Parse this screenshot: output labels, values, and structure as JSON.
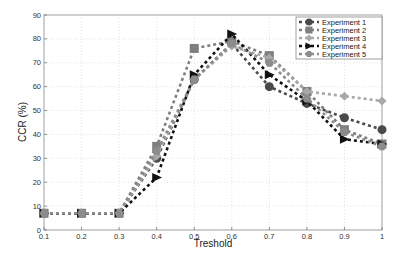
{
  "chart_data": {
    "type": "line",
    "title": "",
    "xlabel": "Treshold",
    "ylabel": "CCR (%)",
    "x": [
      0.1,
      0.2,
      0.3,
      0.4,
      0.5,
      0.6,
      0.7,
      0.8,
      0.9,
      1.0
    ],
    "xticks": [
      "0.1",
      "0.2",
      "0.3",
      "0.4",
      "0.5",
      "0.6",
      "0.7",
      "0.8",
      "0.9",
      "1"
    ],
    "yticks": [
      "0",
      "10",
      "20",
      "30",
      "40",
      "50",
      "60",
      "70",
      "80",
      "90"
    ],
    "xlim": [
      0.1,
      1.0
    ],
    "ylim": [
      0,
      90
    ],
    "grid": true,
    "legend_position": "upper right",
    "series": [
      {
        "name": "Experiment 1",
        "marker": "circle",
        "color": "#4a4a4a",
        "values": [
          7,
          7,
          7,
          30,
          63,
          78,
          60,
          53,
          47,
          42
        ]
      },
      {
        "name": "Experiment 2",
        "marker": "square",
        "color": "#7f7f7f",
        "values": [
          7,
          7,
          7,
          35,
          76,
          79,
          73,
          58,
          42,
          36
        ]
      },
      {
        "name": "Experiment 3",
        "marker": "diamond",
        "color": "#a8a8a8",
        "values": [
          7,
          7,
          7,
          31,
          63,
          77,
          72,
          58,
          56,
          54
        ]
      },
      {
        "name": "Experiment 4",
        "marker": "triangle",
        "color": "#111111",
        "values": [
          7,
          7,
          7,
          22,
          65,
          82,
          65,
          54,
          38,
          36
        ]
      },
      {
        "name": "Experiment 5",
        "marker": "hexagon",
        "color": "#8c8c8c",
        "values": [
          7,
          7,
          7,
          33,
          63,
          78,
          70,
          55,
          41,
          35
        ]
      }
    ]
  }
}
